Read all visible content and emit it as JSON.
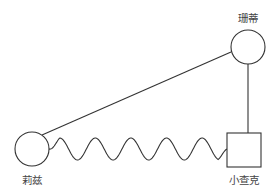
{
  "diagram": {
    "type": "genogram",
    "stroke_color": "#333333",
    "label_color": "#444444",
    "nodes": [
      {
        "id": "sandy",
        "label": "珊蒂",
        "shape": "circle",
        "gender": "female"
      },
      {
        "id": "liz",
        "label": "莉兹",
        "shape": "circle",
        "gender": "female"
      },
      {
        "id": "little-chuck",
        "label": "小查克",
        "shape": "square",
        "gender": "male"
      }
    ],
    "edges": [
      {
        "from": "liz",
        "to": "sandy",
        "style": "straight"
      },
      {
        "from": "sandy",
        "to": "little-chuck",
        "style": "straight"
      },
      {
        "from": "liz",
        "to": "little-chuck",
        "style": "zigzag-wave"
      }
    ]
  }
}
